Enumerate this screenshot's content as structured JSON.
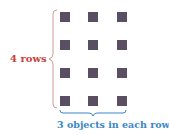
{
  "diagram": {
    "rows": 4,
    "columns": 3,
    "row_label": "4 rows",
    "column_label": "3 objects in each row",
    "colors": {
      "square": "#5a4e63",
      "row_brace": "#c8413a",
      "column_brace": "#3a86c8"
    }
  }
}
